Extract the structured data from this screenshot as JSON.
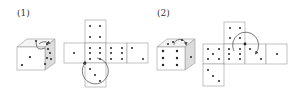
{
  "problems": [
    {
      "label": "(1)",
      "cube": {
        "front_pips": 3,
        "top_pips": 2,
        "right_pips": 5
      },
      "net": {
        "layout": "cross",
        "faces": [
          {
            "position": "top",
            "pips": 4
          },
          {
            "position": "left",
            "pips": 1
          },
          {
            "position": "center",
            "pips": 6
          },
          {
            "position": "right",
            "pips": 6
          },
          {
            "position": "far-right",
            "pips": 2
          },
          {
            "position": "bottom",
            "pips": 3
          }
        ],
        "rotation_arrow": "counter-clockwise around center-left corner"
      }
    },
    {
      "label": "(2)",
      "cube": {
        "front_pips": 6,
        "top_pips": 3,
        "right_pips": 1
      },
      "net": {
        "layout": "T-shape with bottom-left leg",
        "faces": [
          {
            "position": "top",
            "pips": 4
          },
          {
            "position": "left",
            "pips": 5
          },
          {
            "position": "center",
            "pips": 6
          },
          {
            "position": "right",
            "pips": 2
          },
          {
            "position": "far-right",
            "pips": 1
          },
          {
            "position": "bottom-left",
            "pips": 3
          }
        ],
        "rotation_arrow": "clockwise around top-center corner"
      }
    }
  ],
  "colors": {
    "line": "#999999",
    "pip": "#222222",
    "cube_shade": "#e0e0e0",
    "arrow": "#444444"
  }
}
